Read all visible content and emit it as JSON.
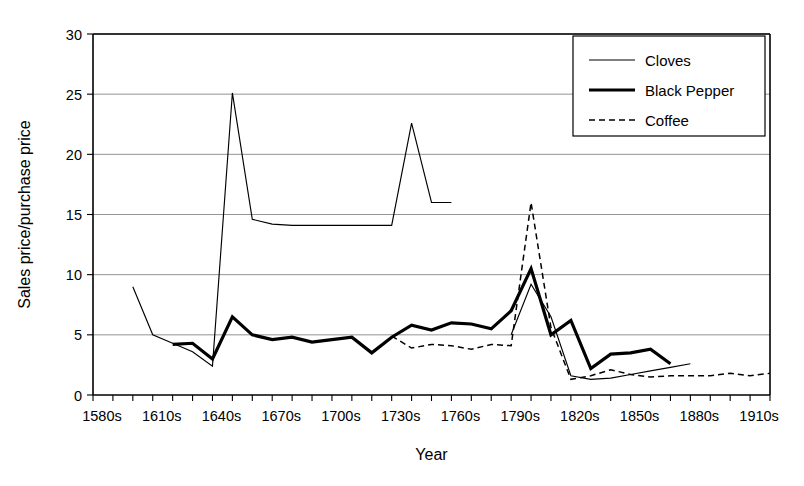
{
  "chart_data": {
    "type": "line",
    "title": "",
    "xlabel": "Year",
    "ylabel": "Sales price/purchase price",
    "xlim": [
      1580,
      1920
    ],
    "ylim": [
      0,
      30
    ],
    "yticks": [
      0,
      5,
      10,
      15,
      20,
      25,
      30
    ],
    "xtick_labels": [
      "1580s",
      "1610s",
      "1640s",
      "1670s",
      "1700s",
      "1730s",
      "1760s",
      "1790s",
      "1820s",
      "1850s",
      "1880s",
      "1910s"
    ],
    "xtick_values": [
      1580,
      1610,
      1640,
      1670,
      1700,
      1730,
      1760,
      1790,
      1820,
      1850,
      1880,
      1910
    ],
    "minor_tick_step_years": 10,
    "grid": "horizontal",
    "legend_position": "top-right",
    "series": [
      {
        "name": "Cloves",
        "style": "thin-solid",
        "color": "#000000",
        "x": [
          1600,
          1610,
          1620,
          1630,
          1640,
          1650,
          1660,
          1670,
          1680,
          1690,
          1700,
          1710,
          1720,
          1730,
          1740,
          1750,
          1760
        ],
        "y": [
          9.0,
          5.0,
          4.3,
          3.6,
          2.4,
          25.1,
          14.6,
          14.2,
          14.1,
          14.1,
          14.1,
          14.1,
          14.1,
          14.1,
          22.6,
          16.0,
          16.0
        ]
      },
      {
        "name": "Cloves (later)",
        "style": "thin-solid",
        "color": "#000000",
        "x": [
          1790,
          1800,
          1810,
          1820,
          1830,
          1840,
          1850,
          1860,
          1870,
          1880
        ],
        "y": [
          5.0,
          9.2,
          6.5,
          1.6,
          1.3,
          1.4,
          1.7,
          2.0,
          2.3,
          2.6
        ]
      },
      {
        "name": "Black Pepper",
        "style": "thick-solid",
        "color": "#000000",
        "x": [
          1620,
          1630,
          1640,
          1650,
          1660,
          1670,
          1680,
          1690,
          1700,
          1710,
          1720,
          1730,
          1740,
          1750,
          1760,
          1770,
          1780,
          1790,
          1800,
          1810,
          1820,
          1830,
          1840,
          1850,
          1860,
          1870
        ],
        "y": [
          4.2,
          4.3,
          3.0,
          6.5,
          5.0,
          4.6,
          4.8,
          4.4,
          4.6,
          4.8,
          3.5,
          4.8,
          5.8,
          5.4,
          6.0,
          5.9,
          5.5,
          7.0,
          10.5,
          5.0,
          6.2,
          2.2,
          3.4,
          3.5,
          3.8,
          2.6
        ]
      },
      {
        "name": "Coffee",
        "style": "dashed",
        "color": "#000000",
        "x": [
          1730,
          1740,
          1750,
          1760,
          1770,
          1780,
          1790,
          1800,
          1810,
          1820,
          1830,
          1840,
          1850,
          1860,
          1870,
          1880,
          1890,
          1900,
          1910,
          1920
        ],
        "y": [
          4.9,
          3.9,
          4.2,
          4.1,
          3.8,
          4.2,
          4.1,
          16.0,
          5.6,
          1.3,
          1.6,
          2.1,
          1.7,
          1.5,
          1.6,
          1.6,
          1.6,
          1.8,
          1.6,
          1.8
        ]
      }
    ],
    "legend_entries": [
      "Cloves",
      "Black Pepper",
      "Coffee"
    ]
  },
  "axes": {
    "x_title": "Year",
    "y_title": "Sales price/purchase price"
  }
}
